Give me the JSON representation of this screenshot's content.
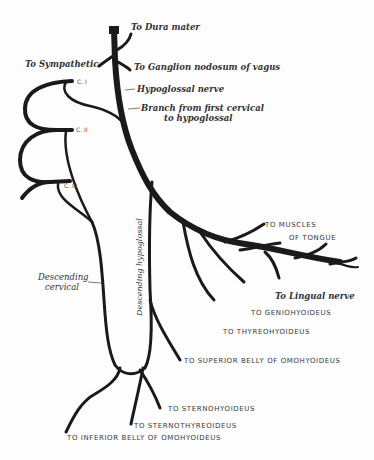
{
  "diagram": {
    "labels": {
      "dura_mater": "To Dura mater",
      "sympathetic": "To Sympathetic",
      "ganglion_nodosum": "To Ganglion nodosum of vagus",
      "hypoglossal_nerve": "Hypoglossal nerve",
      "branch_first_cervical_1": "Branch from first cervical",
      "branch_first_cervical_2": "to hypoglossal",
      "c1": "C. I",
      "c2": "C. II",
      "c3": "C. III",
      "descending_cervical_1": "Descending",
      "descending_cervical_2": "cervical",
      "descending_hypoglossal": "Descending hypoglossal",
      "muscles_tongue_1": "TO MUSCLES",
      "muscles_tongue_2": "OF TONGUE",
      "lingual_nerve": "To Lingual nerve",
      "geniohyoideus": "TO GENIOHYOIDEUS",
      "thyreohyoideus": "TO THYREOHYOIDEUS",
      "superior_omohyoideus": "TO SUPERIOR BELLY OF OMOHYOIDEUS",
      "sternohyoideus": "TO STERNOHYOIDEUS",
      "sternothyreoideus": "TO STERNOTHYREOIDEUS",
      "inferior_omohyoideus": "TO INFERIOR BELLY OF OMOHYOIDEUS"
    },
    "colors": {
      "nerve": "#1a1a1a",
      "background": "#fdfdfd",
      "text": "#2a2a2a"
    }
  }
}
